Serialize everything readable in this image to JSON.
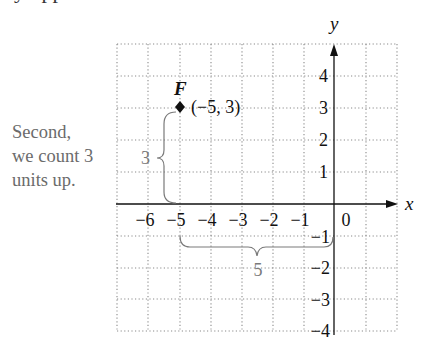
{
  "cropped_top_line": "y upp",
  "caption": {
    "lines": [
      "Second,",
      "we count 3",
      "units up."
    ]
  },
  "graph": {
    "x_axis_label": "x",
    "y_axis_label": "y",
    "x_tick_labels": [
      "−6",
      "−5",
      "−4",
      "−3",
      "−2",
      "−1"
    ],
    "origin_label": "0",
    "y_tick_labels_positive": [
      "1",
      "2",
      "3",
      "4"
    ],
    "y_tick_labels_negative": [
      "−1",
      "−2",
      "−3",
      "−4"
    ],
    "point": {
      "name": "F",
      "coordinates_label": "(−5, 3)",
      "x": -5,
      "y": 3
    },
    "vertical_brace_label": "3",
    "horizontal_brace_label": "5",
    "grid": {
      "x_range": [
        -7,
        2
      ],
      "y_range": [
        -4,
        5
      ],
      "style": "dotted"
    },
    "colors": {
      "axis": "#111111",
      "grid": "#8a8a8a",
      "annotation": "#7a7a7a",
      "caption": "#6b6b6b"
    }
  }
}
